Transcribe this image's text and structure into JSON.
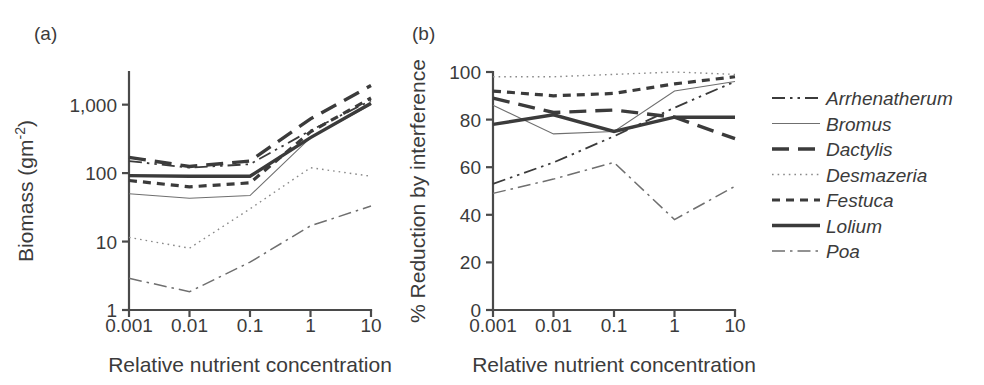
{
  "figure": {
    "panels": [
      {
        "id": "a",
        "label": "(a)"
      },
      {
        "id": "b",
        "label": "(b)"
      }
    ]
  },
  "legend": {
    "position": "right",
    "entries": [
      {
        "label": "Arrhenatherum",
        "style": "dash-dot-dot",
        "width": 1.8,
        "color": "#3b3b3b"
      },
      {
        "label": "Bromus",
        "style": "solid-thin",
        "width": 1.1,
        "color": "#6f6f6f"
      },
      {
        "label": "Dactylis",
        "style": "long-dash",
        "width": 3.4,
        "color": "#3b3b3b"
      },
      {
        "label": "Desmazeria",
        "style": "dotted",
        "width": 1.4,
        "color": "#8a8a8a"
      },
      {
        "label": "Festuca",
        "style": "short-dash",
        "width": 3.2,
        "color": "#3b3b3b"
      },
      {
        "label": "Lolium",
        "style": "solid-thick",
        "width": 3.4,
        "color": "#3b3b3b"
      },
      {
        "label": "Poa",
        "style": "dash-dot",
        "width": 1.5,
        "color": "#6f6f6f"
      }
    ]
  },
  "chart_data": [
    {
      "type": "line",
      "panel": "a",
      "title": "(a)",
      "xlabel": "Relative nutrient concentration",
      "ylabel": "Biomass (gm-2)",
      "ylabel_display": "Biomass (gm",
      "ylabel_sup": "-2",
      "ylabel_tail": ")",
      "xscale": "log",
      "yscale": "log",
      "x": [
        0.001,
        0.01,
        0.1,
        1,
        10
      ],
      "xticklabels": [
        "0.001",
        "0.01",
        "0.1",
        "1",
        "10"
      ],
      "yticks": [
        1,
        10,
        100,
        1000
      ],
      "yticklabels": [
        "1",
        "10",
        "100",
        "1,000"
      ],
      "ylim": [
        1,
        3000
      ],
      "grid": false,
      "series": [
        {
          "name": "Arrhenatherum",
          "values": [
            150,
            120,
            135,
            420,
            1150
          ]
        },
        {
          "name": "Bromus",
          "values": [
            50,
            43,
            47,
            330,
            1000
          ]
        },
        {
          "name": "Dactylis",
          "values": [
            170,
            125,
            150,
            620,
            1900
          ]
        },
        {
          "name": "Desmazeria",
          "values": [
            11.5,
            8.0,
            30,
            120,
            90
          ]
        },
        {
          "name": "Festuca",
          "values": [
            78,
            63,
            72,
            400,
            1250
          ]
        },
        {
          "name": "Lolium",
          "values": [
            92,
            90,
            90,
            330,
            1050
          ]
        },
        {
          "name": "Poa",
          "values": [
            2.9,
            1.85,
            5.0,
            17,
            33
          ]
        }
      ]
    },
    {
      "type": "line",
      "panel": "b",
      "title": "(b)",
      "xlabel": "Relative nutrient concentration",
      "ylabel": "% Reduction by interference",
      "xscale": "log",
      "yscale": "linear",
      "x": [
        0.001,
        0.01,
        0.1,
        1,
        10
      ],
      "xticklabels": [
        "0.001",
        "0.01",
        "0.1",
        "1",
        "10"
      ],
      "yticks": [
        0,
        20,
        40,
        60,
        80,
        100
      ],
      "yticklabels": [
        "0",
        "20",
        "40",
        "60",
        "80",
        "100"
      ],
      "ylim": [
        0,
        100
      ],
      "grid": false,
      "series": [
        {
          "name": "Arrhenatherum",
          "values": [
            53,
            62,
            73,
            85,
            96
          ]
        },
        {
          "name": "Bromus",
          "values": [
            86,
            74,
            75,
            92,
            96
          ]
        },
        {
          "name": "Dactylis",
          "values": [
            89,
            83,
            84,
            81,
            72
          ]
        },
        {
          "name": "Desmazeria",
          "values": [
            98,
            98,
            99,
            100,
            99
          ]
        },
        {
          "name": "Festuca",
          "values": [
            92,
            90,
            91,
            95,
            98
          ]
        },
        {
          "name": "Lolium",
          "values": [
            78,
            82,
            75,
            81,
            81
          ]
        },
        {
          "name": "Poa",
          "values": [
            49,
            55,
            62,
            38,
            52
          ]
        }
      ]
    }
  ]
}
